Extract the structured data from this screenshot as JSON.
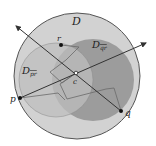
{
  "diagram": {
    "type": "geometric-disks",
    "colors": {
      "background": "#ffffff",
      "outer_disk_fill": "#d2d2d2",
      "outer_disk_stroke": "#555555",
      "disk_pr_fill": "#bdbdbd",
      "disk_qr_fill": "#9c9c9c",
      "line_color": "#333333",
      "polyline_color": "#6a6a6a",
      "point_color": "#111111"
    },
    "labels": {
      "outer_disk": "D",
      "disk_qr": "D",
      "disk_qr_sub": "qr",
      "disk_pr": "D",
      "disk_pr_sub": "pr",
      "point_r": "r",
      "point_c": "c",
      "point_p": "p",
      "point_q": "q"
    },
    "disks": [
      {
        "name": "D",
        "cx": 77,
        "cy": 76,
        "r": 63
      },
      {
        "name": "D_pr",
        "cx": 56,
        "cy": 80,
        "r": 37
      },
      {
        "name": "D_qr",
        "cx": 93,
        "cy": 80,
        "r": 41
      }
    ],
    "points": [
      {
        "name": "r",
        "x": 61,
        "y": 45
      },
      {
        "name": "c",
        "x": 76,
        "y": 73
      },
      {
        "name": "p",
        "x": 20,
        "y": 98
      },
      {
        "name": "q",
        "x": 121,
        "y": 111
      }
    ],
    "lines": [
      {
        "name": "line-through-q",
        "x1": 16,
        "y1": 26,
        "x2": 121,
        "y2": 111
      },
      {
        "name": "line-through-p",
        "x1": 20,
        "y1": 98,
        "x2": 146,
        "y2": 43
      }
    ]
  }
}
